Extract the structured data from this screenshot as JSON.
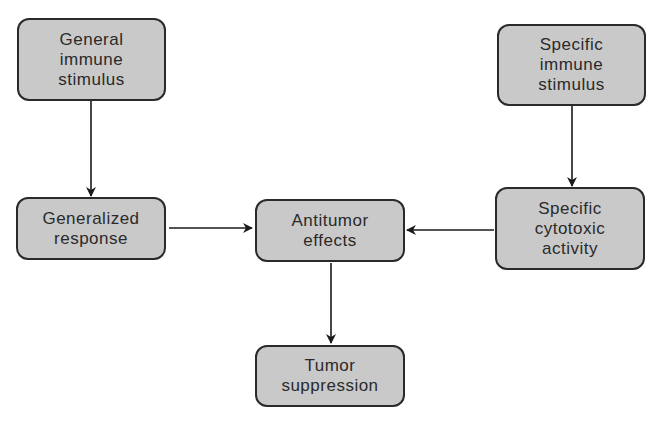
{
  "diagram": {
    "nodes": [
      {
        "id": "general-stimulus",
        "lines": [
          "General",
          "immune",
          "stimulus"
        ]
      },
      {
        "id": "specific-stimulus",
        "lines": [
          "Specific",
          "immune",
          "stimulus"
        ]
      },
      {
        "id": "generalized-response",
        "lines": [
          "Generalized",
          "response"
        ]
      },
      {
        "id": "antitumor-effects",
        "lines": [
          "Antitumor",
          "effects"
        ]
      },
      {
        "id": "specific-cytotoxic",
        "lines": [
          "Specific",
          "cytotoxic",
          "activity"
        ]
      },
      {
        "id": "tumor-suppression",
        "lines": [
          "Tumor",
          "suppression"
        ]
      }
    ],
    "edges": [
      {
        "from": "general-stimulus",
        "to": "generalized-response"
      },
      {
        "from": "specific-stimulus",
        "to": "specific-cytotoxic"
      },
      {
        "from": "generalized-response",
        "to": "antitumor-effects"
      },
      {
        "from": "specific-cytotoxic",
        "to": "antitumor-effects"
      },
      {
        "from": "antitumor-effects",
        "to": "tumor-suppression"
      }
    ]
  }
}
